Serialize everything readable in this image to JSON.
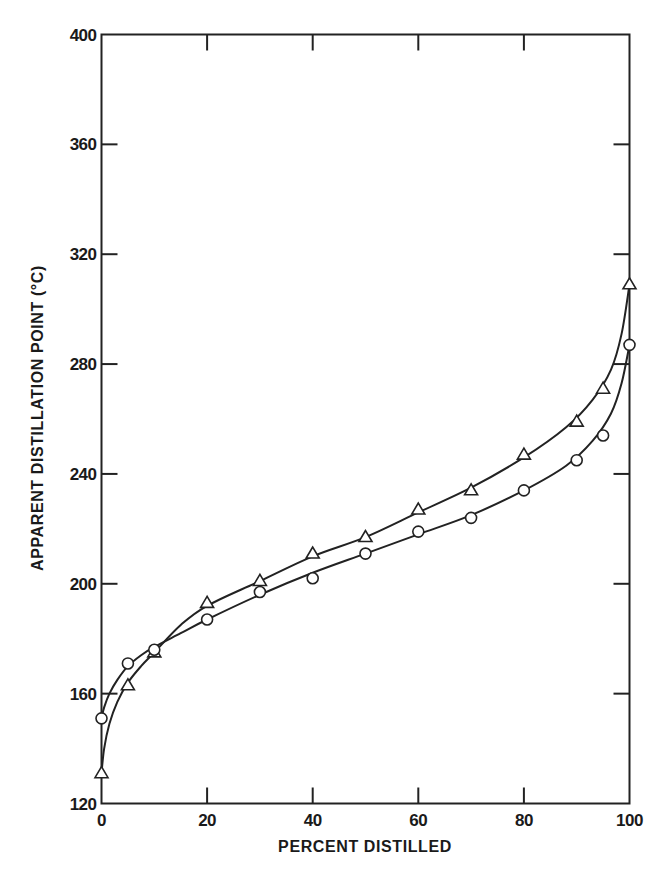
{
  "chart_data": {
    "type": "line",
    "title": "",
    "xlabel": "PERCENT DISTILLED",
    "ylabel": "APPARENT DISTILLATION POINT (°C)",
    "xlim": [
      0,
      100
    ],
    "ylim": [
      120,
      400
    ],
    "xticks": [
      0,
      20,
      40,
      60,
      80,
      100
    ],
    "yticks": [
      120,
      160,
      200,
      240,
      280,
      320,
      360,
      400
    ],
    "grid": false,
    "legend": null,
    "series": [
      {
        "name": "triangles",
        "marker": "triangle",
        "x": [
          0,
          5,
          10,
          20,
          30,
          40,
          50,
          60,
          70,
          80,
          90,
          95,
          100
        ],
        "y": [
          131,
          163,
          175,
          193,
          201,
          211,
          217,
          227,
          234,
          247,
          259,
          271,
          309
        ]
      },
      {
        "name": "circles",
        "marker": "circle",
        "x": [
          0,
          5,
          10,
          20,
          30,
          40,
          50,
          60,
          70,
          80,
          90,
          95,
          100
        ],
        "y": [
          151,
          171,
          176,
          187,
          197,
          202,
          211,
          219,
          224,
          234,
          245,
          254,
          287
        ]
      }
    ],
    "fit_curves": [
      {
        "series": "triangles",
        "x": [
          0,
          0.5,
          1.5,
          3,
          5,
          7.5,
          10,
          15,
          20,
          30,
          40,
          50,
          60,
          70,
          80,
          88,
          93,
          96.5,
          98.5,
          100
        ],
        "y": [
          131,
          140,
          149,
          157,
          164,
          170,
          175,
          185,
          192,
          201,
          210,
          217,
          226,
          235,
          246,
          257,
          267,
          278,
          291,
          309
        ]
      },
      {
        "series": "circles",
        "x": [
          0,
          0.5,
          1.5,
          3,
          5,
          7.5,
          10,
          15,
          20,
          30,
          40,
          50,
          60,
          70,
          80,
          88,
          93,
          96.5,
          98.5,
          100
        ],
        "y": [
          151,
          155,
          160,
          165,
          170,
          174,
          177,
          182,
          187,
          196,
          204,
          211,
          218,
          225,
          234,
          243,
          252,
          262,
          273,
          287
        ]
      }
    ]
  }
}
